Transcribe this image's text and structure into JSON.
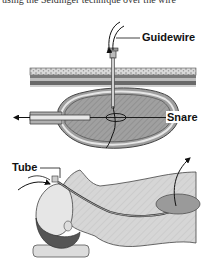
{
  "figure": {
    "caption_top": "using the Seldinger technique over the wire",
    "labels": {
      "guidewire": "Guidewire",
      "snare": "Snare",
      "tube": "Tube"
    },
    "colors": {
      "stomach_fill": "#9a9a9a",
      "stomach_wall": "#6e6e6e",
      "abdominal_wall_light": "#c8c8c8",
      "abdominal_wall_dark": "#5a5a5a",
      "body_fill": "#d4d4d4",
      "hair": "#555555",
      "pillow": "#dcdcdc",
      "line": "#222222"
    }
  }
}
